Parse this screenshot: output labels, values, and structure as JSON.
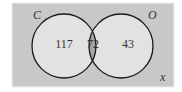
{
  "diagram": {
    "type": "venn",
    "universe_label": "x",
    "sets": [
      {
        "name": "C",
        "only_count": "117"
      },
      {
        "name": "O",
        "only_count": "43"
      }
    ],
    "intersection_count": "72",
    "colors": {
      "universe_fill": "#c8c8c8",
      "circle_fill": "#e2e2e2",
      "intersection_fill": "#a6a6a6",
      "stroke": "#1a1a1a"
    }
  }
}
